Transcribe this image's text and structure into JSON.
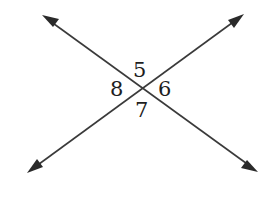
{
  "diagram": {
    "stroke_color": "#3a3a3a",
    "background": "#ffffff",
    "intersection": {
      "x": 139,
      "y": 89
    },
    "lines": [
      {
        "name": "line-a",
        "from": {
          "x": 42,
          "y": 15
        },
        "to": {
          "x": 258,
          "y": 172
        },
        "arrows": "both"
      },
      {
        "name": "line-b",
        "from": {
          "x": 27,
          "y": 173
        },
        "to": {
          "x": 244,
          "y": 14
        },
        "arrows": "both"
      }
    ],
    "angles": [
      {
        "label": "5",
        "position": "top"
      },
      {
        "label": "6",
        "position": "right"
      },
      {
        "label": "7",
        "position": "bottom"
      },
      {
        "label": "8",
        "position": "left"
      }
    ]
  }
}
